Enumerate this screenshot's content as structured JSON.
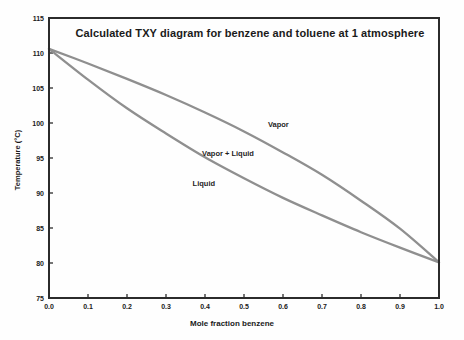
{
  "chart_data": {
    "type": "line",
    "title": "Calculated TXY diagram for benzene and toluene at 1 atmosphere",
    "xlabel": "Mole fraction benzene",
    "ylabel": "Temperature (°C)",
    "xlim": [
      0.0,
      1.0
    ],
    "ylim": [
      75,
      115
    ],
    "x_tick_labels": [
      "0.0",
      "0.1",
      "0.2",
      "0.3",
      "0.4",
      "0.5",
      "0.6",
      "0.7",
      "0.8",
      "0.9",
      "1.0"
    ],
    "y_tick_labels": [
      "75",
      "80",
      "85",
      "90",
      "95",
      "100",
      "105",
      "110",
      "115"
    ],
    "grid": false,
    "legend": "none",
    "x": [
      0.0,
      0.1,
      0.2,
      0.3,
      0.4,
      0.5,
      0.6,
      0.7,
      0.8,
      0.9,
      1.0
    ],
    "series": [
      {
        "name": "Vapor (dew point) curve",
        "key": "dew-point-curve",
        "values": [
          110.6,
          108.5,
          106.3,
          104.0,
          101.5,
          98.8,
          95.8,
          92.6,
          88.9,
          84.9,
          80.1
        ]
      },
      {
        "name": "Liquid (bubble point) curve",
        "key": "bubble-point-curve",
        "values": [
          110.6,
          106.2,
          102.1,
          98.5,
          95.1,
          92.1,
          89.3,
          86.8,
          84.4,
          82.2,
          80.1
        ]
      }
    ],
    "annotations": [
      {
        "label": "Vapor",
        "x": 0.588,
        "t": 99.9
      },
      {
        "label": "Vapor + Liquid",
        "x": 0.459,
        "t": 95.7
      },
      {
        "label": "Liquid",
        "x": 0.397,
        "t": 91.5
      }
    ],
    "colors": {
      "curve": "#8f8f8f",
      "axis": "#2b2b2b",
      "text": "#1a1a1a",
      "background": "#ffffff"
    }
  }
}
